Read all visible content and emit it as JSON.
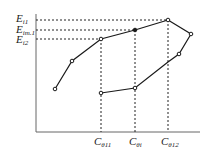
{
  "diagram": {
    "type": "hysteresis-loop",
    "y_labels": [
      {
        "base": "E",
        "sub": "i1",
        "y": 20
      },
      {
        "base": "E",
        "sub": "im.1",
        "y": 30
      },
      {
        "base": "E",
        "sub": "i2",
        "y": 39
      }
    ],
    "x_labels": [
      {
        "base": "C",
        "sub": "θ11",
        "x": 101
      },
      {
        "base": "C",
        "sub": "θi",
        "x": 135
      },
      {
        "base": "C",
        "sub": "θ12",
        "x": 168
      }
    ],
    "upper_curve": [
      [
        55,
        89
      ],
      [
        72,
        61
      ],
      [
        101,
        39
      ],
      [
        135,
        30
      ],
      [
        168,
        20
      ]
    ],
    "lower_curve": [
      [
        168,
        20
      ],
      [
        191,
        34
      ],
      [
        179,
        54
      ],
      [
        168,
        62
      ],
      [
        135,
        88
      ],
      [
        101,
        93
      ]
    ],
    "colors": {
      "line": "#1a1a1a",
      "axis": "#555555"
    }
  }
}
